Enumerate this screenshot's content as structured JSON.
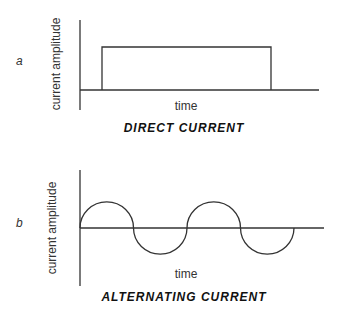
{
  "figure": {
    "panels": [
      {
        "letter": "a",
        "ylabel": "current amplitude",
        "xlabel": "time",
        "caption": "DIRECT CURRENT",
        "waveform": "rectangular pulse"
      },
      {
        "letter": "b",
        "ylabel": "current amplitude",
        "xlabel": "time",
        "caption": "ALTERNATING CURRENT",
        "waveform": "sinusoid (2 full cycles)"
      }
    ],
    "colors": {
      "line": "#333333",
      "text": "#222222",
      "background": "#ffffff"
    }
  }
}
